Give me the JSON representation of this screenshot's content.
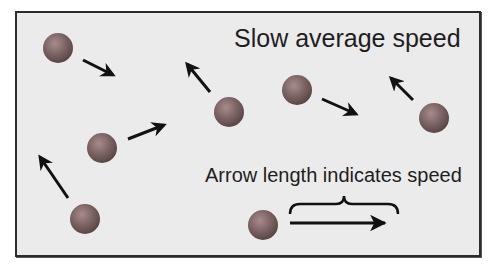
{
  "figure": {
    "title": "Slow average speed",
    "legend": {
      "label": "Arrow length indicates speed",
      "arrow": {
        "x1": 290,
        "y1": 223,
        "x2": 397,
        "y2": 223
      },
      "brace": {
        "x1": 290,
        "x2": 398,
        "y": 208
      }
    },
    "colors": {
      "panel_background": "#ebebeb",
      "panel_border": "#2b2b2b",
      "sphere_base": "#7d6464",
      "sphere_highlight": "#a88c8c",
      "sphere_shadow": "#5a4646",
      "arrow": "#111111",
      "text": "#1e1e1e"
    },
    "particles": [
      {
        "id": 1,
        "cx": 58,
        "cy": 48,
        "r": 15,
        "arrow": {
          "x1": 83,
          "y1": 60,
          "x2": 113,
          "y2": 75
        }
      },
      {
        "id": 2,
        "cx": 229,
        "cy": 112,
        "r": 15,
        "arrow": {
          "x1": 210,
          "y1": 92,
          "x2": 187,
          "y2": 64
        }
      },
      {
        "id": 3,
        "cx": 297,
        "cy": 90,
        "r": 15,
        "arrow": {
          "x1": 322,
          "y1": 99,
          "x2": 356,
          "y2": 114
        }
      },
      {
        "id": 4,
        "cx": 434,
        "cy": 118,
        "r": 15,
        "arrow": {
          "x1": 413,
          "y1": 100,
          "x2": 391,
          "y2": 78
        }
      },
      {
        "id": 5,
        "cx": 102,
        "cy": 148,
        "r": 15,
        "arrow": {
          "x1": 128,
          "y1": 139,
          "x2": 164,
          "y2": 125
        }
      },
      {
        "id": 6,
        "cx": 85,
        "cy": 219,
        "r": 15,
        "arrow": {
          "x1": 68,
          "y1": 198,
          "x2": 40,
          "y2": 157
        }
      },
      {
        "id": 7,
        "cx": 263,
        "cy": 225,
        "r": 15,
        "arrow": null
      }
    ]
  }
}
